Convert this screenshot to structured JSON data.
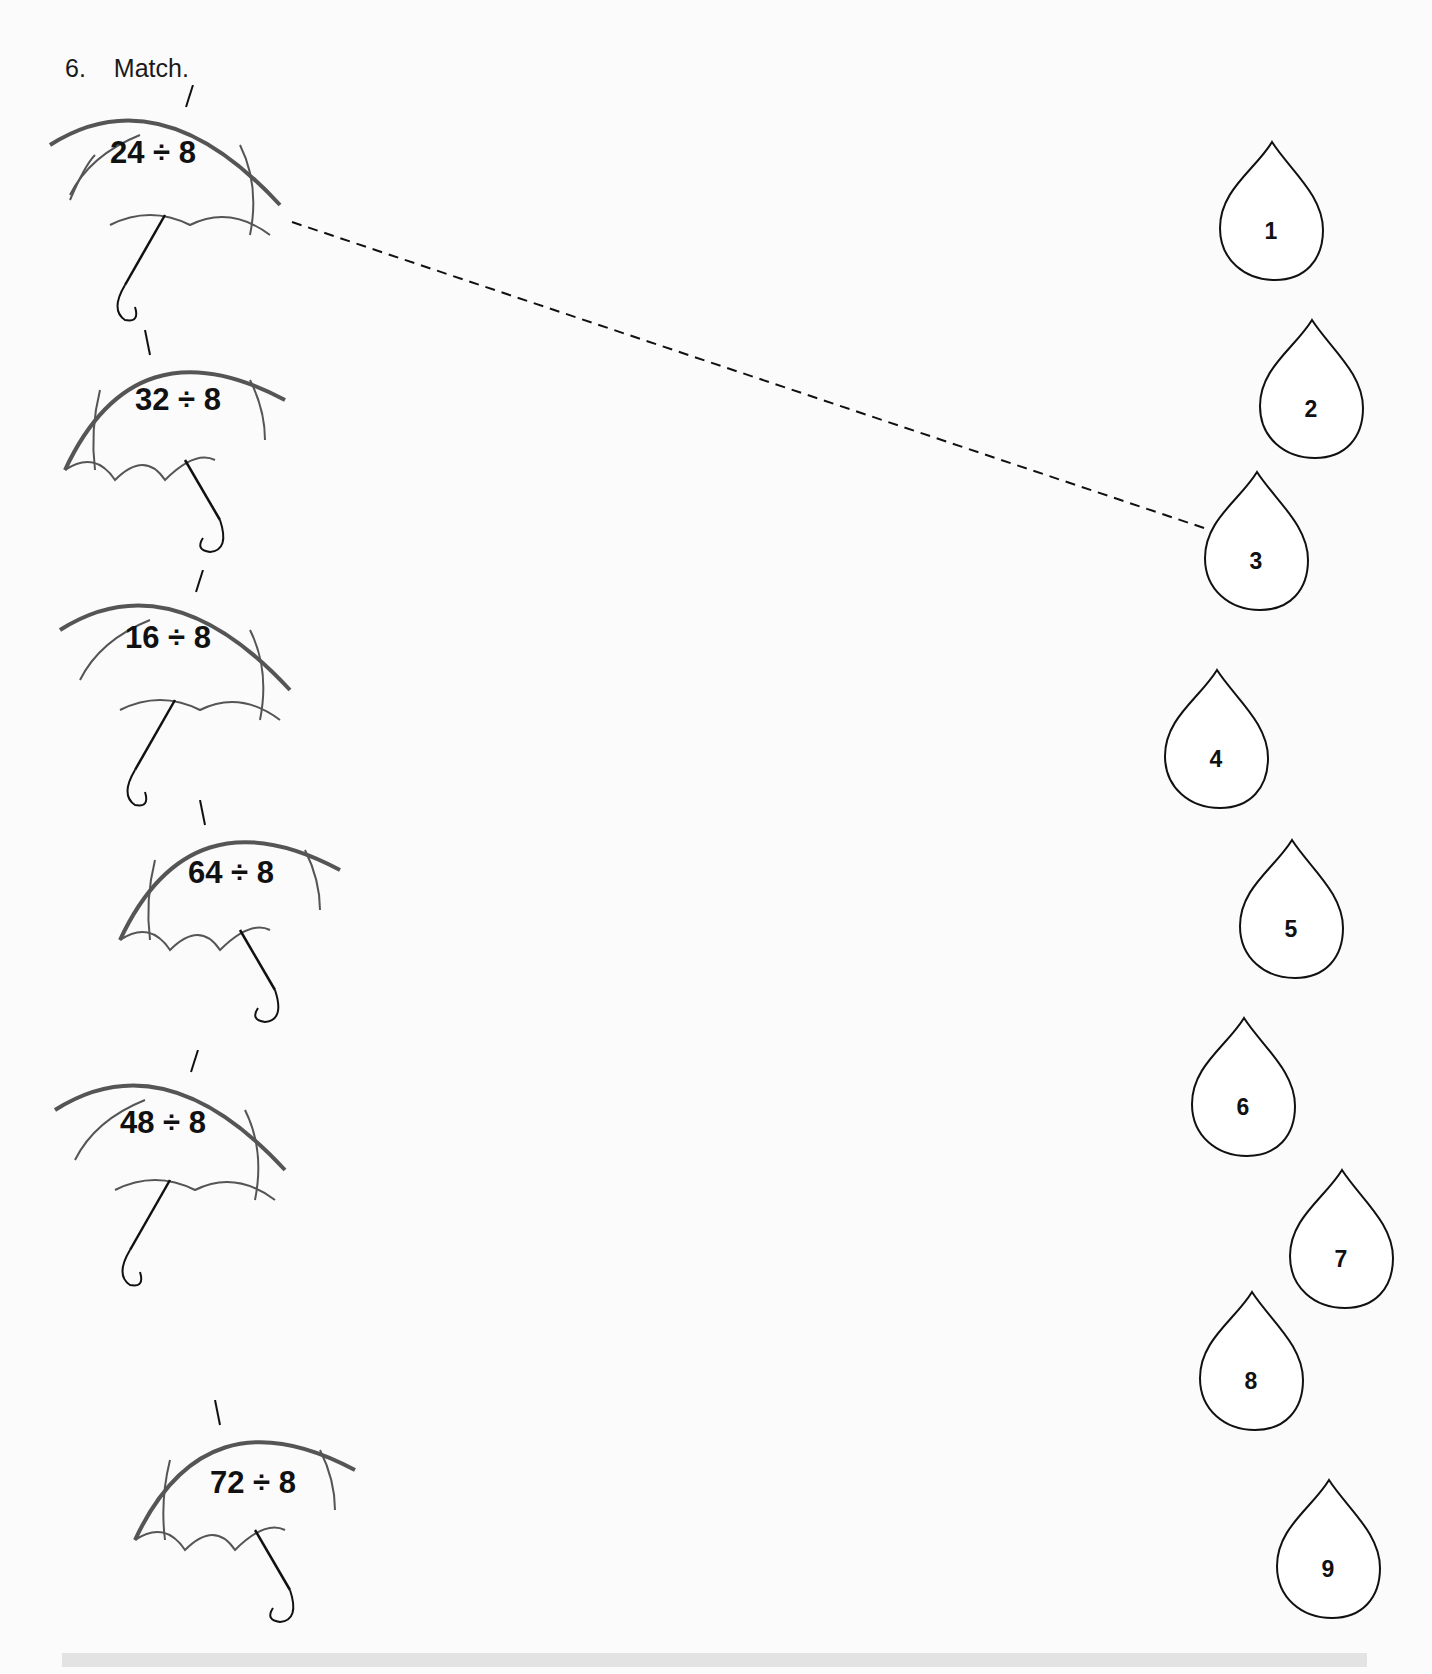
{
  "question": {
    "number": "6.",
    "instruction": "Match."
  },
  "umbrellas": [
    {
      "expression": "24 ÷ 8",
      "orientation": "right"
    },
    {
      "expression": "32 ÷ 8",
      "orientation": "left"
    },
    {
      "expression": "16 ÷ 8",
      "orientation": "right"
    },
    {
      "expression": "64 ÷ 8",
      "orientation": "left"
    },
    {
      "expression": "48 ÷ 8",
      "orientation": "right"
    },
    {
      "expression": "72 ÷ 8",
      "orientation": "left"
    }
  ],
  "drops": [
    {
      "value": "1"
    },
    {
      "value": "2"
    },
    {
      "value": "3"
    },
    {
      "value": "4"
    },
    {
      "value": "5"
    },
    {
      "value": "6"
    },
    {
      "value": "7"
    },
    {
      "value": "8"
    },
    {
      "value": "9"
    }
  ],
  "example_match": {
    "from": "24 ÷ 8",
    "to": "3",
    "line_style": "dashed"
  },
  "colors": {
    "ink": "#111111",
    "paper": "#fbfbfb",
    "umbrella_stroke": "#555555"
  }
}
